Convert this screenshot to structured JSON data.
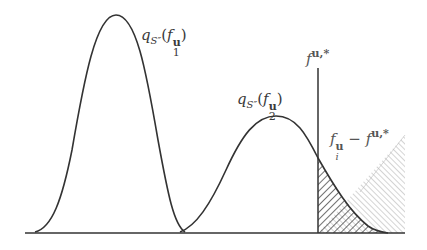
{
  "diagram": {
    "type": "density-curves-with-threshold",
    "colors": {
      "stroke": "#333333",
      "hatch_dark": "#333333",
      "hatch_light": "#9a9a9a",
      "background": "#ffffff"
    },
    "labels": {
      "curve1": {
        "q": "q",
        "S": "S″",
        "open": "(",
        "f": "f",
        "bold": "u",
        "sub": "1",
        "close": ")"
      },
      "curve2": {
        "q": "q",
        "S": "S″",
        "open": "(",
        "f": "f",
        "bold": "u",
        "sub": "2",
        "close": ")"
      },
      "threshold": {
        "f": "f",
        "sup": "u,*"
      },
      "difference": {
        "f1": "f",
        "bold1": "u",
        "sub1": "i",
        "minus": " − ",
        "f2": "f",
        "sup2": "u,*"
      }
    },
    "curves": [
      {
        "name": "q_S''(f1^u)",
        "peak_x": 116,
        "peak_y": 15,
        "left_x": 35,
        "right_x": 185
      },
      {
        "name": "q_S''(f2^u)",
        "peak_x": 276,
        "peak_y": 116,
        "left_x": 182,
        "right_x": 388
      }
    ],
    "threshold_x": 318,
    "baseline_y": 233
  }
}
